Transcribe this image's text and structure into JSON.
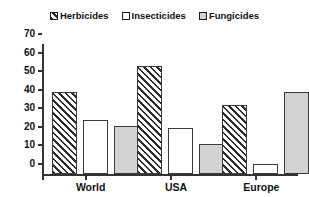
{
  "chart_data": {
    "type": "bar",
    "title": "",
    "subtitle": "",
    "xlabel": "",
    "ylabel": "",
    "categories": [
      "World",
      "USA",
      "Europe"
    ],
    "series": [
      {
        "name": "Herbicides",
        "values": [
          44,
          58,
          37
        ],
        "fill": "hatch",
        "color": "#2b2b2b"
      },
      {
        "name": "Insecticides",
        "values": [
          29,
          25,
          5.5
        ],
        "fill": "white",
        "color": "#ffffff"
      },
      {
        "name": "Fungicides",
        "values": [
          26,
          16,
          44
        ],
        "fill": "gray",
        "color": "#d2d2d2"
      }
    ],
    "ylim": [
      0,
      70
    ],
    "yticks": [
      0,
      10,
      20,
      30,
      40,
      50,
      60,
      70
    ],
    "ytick_labels": [
      "0",
      "10",
      "20",
      "30",
      "40",
      "50",
      "60",
      "70"
    ],
    "grid": false,
    "legend_position": "top-center",
    "axis_color": "#333333",
    "bar_border_color": "#3a3a3a",
    "background": "#ffffff"
  },
  "legend": {
    "items": [
      {
        "label": "Herbicides"
      },
      {
        "label": "Insecticides"
      },
      {
        "label": "Fungicides"
      }
    ]
  }
}
